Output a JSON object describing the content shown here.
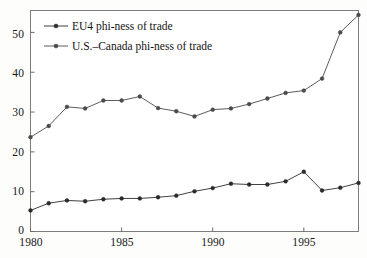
{
  "chart_data": {
    "type": "line",
    "title": "",
    "subtitle": "",
    "xlabel": "",
    "ylabel": "",
    "xlim": [
      1980,
      1998
    ],
    "ylim": [
      0,
      55.5
    ],
    "grid": false,
    "legend_position": "upper-left-inside",
    "x": [
      1980,
      1981,
      1982,
      1983,
      1984,
      1985,
      1986,
      1987,
      1988,
      1989,
      1990,
      1991,
      1992,
      1993,
      1994,
      1995,
      1996,
      1997,
      1998
    ],
    "xticks": [
      1980,
      1985,
      1990,
      1995
    ],
    "xtick_labels": [
      "1980",
      "1985",
      "1990",
      "1995"
    ],
    "yticks": [
      0,
      10,
      20,
      30,
      40,
      50
    ],
    "ytick_labels": [
      "0",
      "10",
      "20",
      "30",
      "40",
      "50"
    ],
    "series": [
      {
        "name": "EU4 phi-ness of trade",
        "marker": "filled-circle",
        "color": "#2b2b2b",
        "values": [
          5.3,
          7.1,
          7.8,
          7.6,
          8.1,
          8.3,
          8.3,
          8.6,
          9.0,
          10.1,
          10.9,
          12.0,
          11.8,
          11.8,
          12.6,
          15.0,
          10.3,
          11.0,
          12.2
        ]
      },
      {
        "name": "U.S.–Canada phi-ness of trade",
        "marker": "filled-circle",
        "color": "#4a4a4a",
        "values": [
          23.7,
          26.5,
          31.3,
          30.9,
          32.9,
          32.9,
          33.9,
          31.0,
          30.2,
          28.9,
          30.6,
          30.9,
          32.0,
          33.4,
          34.8,
          35.4,
          38.4,
          50.0,
          54.4
        ]
      }
    ]
  },
  "legend": {
    "entries": [
      {
        "label": "EU4 phi-ness of trade"
      },
      {
        "label": "U.S.–Canada phi-ness of trade"
      }
    ]
  },
  "axes": {
    "y_labels": [
      "50",
      "40",
      "30",
      "20",
      "10",
      "0"
    ],
    "x_labels": [
      "1980",
      "1985",
      "1990",
      "1995"
    ]
  }
}
